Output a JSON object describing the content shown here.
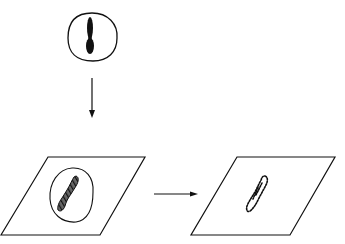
{
  "diagram": {
    "colors": {
      "stroke": "#111111",
      "background": "#ffffff",
      "fill": "#111111"
    },
    "nodes": [
      {
        "id": "cell-with-chromosome",
        "label": ""
      },
      {
        "id": "slide-with-cell",
        "label": ""
      },
      {
        "id": "slide-with-dotted-chromosome",
        "label": ""
      }
    ],
    "edges": [
      {
        "from": "cell-with-chromosome",
        "to": "slide-with-cell",
        "direction": "down"
      },
      {
        "from": "slide-with-cell",
        "to": "slide-with-dotted-chromosome",
        "direction": "right"
      }
    ]
  }
}
